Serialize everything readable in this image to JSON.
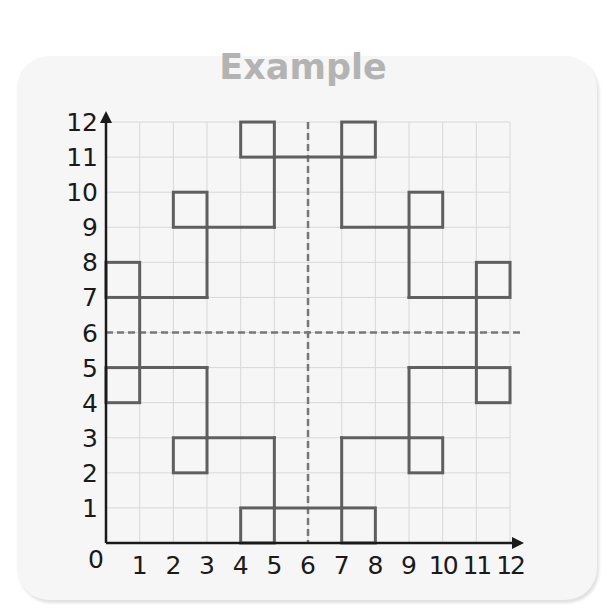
{
  "title": "Example",
  "chart_data": {
    "type": "grid-diagram",
    "title": "Example",
    "xlabel": "",
    "ylabel": "",
    "xlim": [
      0,
      12
    ],
    "ylim": [
      0,
      12
    ],
    "grid": true,
    "x_ticks": [
      "0",
      "1",
      "2",
      "3",
      "4",
      "5",
      "6",
      "7",
      "8",
      "9",
      "10",
      "11",
      "12"
    ],
    "y_ticks": [
      "0",
      "1",
      "2",
      "3",
      "4",
      "5",
      "6",
      "7",
      "8",
      "9",
      "10",
      "11",
      "12"
    ],
    "lines_of_symmetry": [
      {
        "orientation": "vertical",
        "x": 6,
        "style": "dashed"
      },
      {
        "orientation": "horizontal",
        "y": 6,
        "style": "dashed"
      }
    ],
    "squares": [
      {
        "x": 4,
        "y": 11
      },
      {
        "x": 7,
        "y": 11
      },
      {
        "x": 2,
        "y": 9
      },
      {
        "x": 9,
        "y": 9
      },
      {
        "x": 0,
        "y": 7
      },
      {
        "x": 11,
        "y": 7
      },
      {
        "x": 0,
        "y": 4
      },
      {
        "x": 11,
        "y": 4
      },
      {
        "x": 2,
        "y": 2
      },
      {
        "x": 9,
        "y": 2
      },
      {
        "x": 4,
        "y": 0
      },
      {
        "x": 7,
        "y": 0
      }
    ],
    "segments": [
      [
        [
          5,
          11
        ],
        [
          7,
          11
        ]
      ],
      [
        [
          5,
          11
        ],
        [
          5,
          9
        ]
      ],
      [
        [
          3,
          9
        ],
        [
          5,
          9
        ]
      ],
      [
        [
          3,
          9
        ],
        [
          3,
          7
        ]
      ],
      [
        [
          1,
          7
        ],
        [
          3,
          7
        ]
      ],
      [
        [
          7,
          11
        ],
        [
          7,
          9
        ]
      ],
      [
        [
          7,
          9
        ],
        [
          9,
          9
        ]
      ],
      [
        [
          9,
          9
        ],
        [
          9,
          7
        ]
      ],
      [
        [
          9,
          7
        ],
        [
          11,
          7
        ]
      ],
      [
        [
          1,
          7
        ],
        [
          1,
          5
        ]
      ],
      [
        [
          11,
          7
        ],
        [
          11,
          5
        ]
      ],
      [
        [
          1,
          5
        ],
        [
          3,
          5
        ]
      ],
      [
        [
          3,
          5
        ],
        [
          3,
          3
        ]
      ],
      [
        [
          3,
          3
        ],
        [
          5,
          3
        ]
      ],
      [
        [
          5,
          3
        ],
        [
          5,
          1
        ]
      ],
      [
        [
          9,
          5
        ],
        [
          11,
          5
        ]
      ],
      [
        [
          9,
          5
        ],
        [
          9,
          3
        ]
      ],
      [
        [
          7,
          3
        ],
        [
          9,
          3
        ]
      ],
      [
        [
          7,
          3
        ],
        [
          7,
          1
        ]
      ],
      [
        [
          5,
          1
        ],
        [
          7,
          1
        ]
      ]
    ]
  },
  "colors": {
    "shape": "#5f5f5f",
    "axis": "#1a1a1a",
    "grid": "#d8d8d8",
    "dashed": "#777777",
    "title": "#b3b3b3",
    "card": "#f6f6f6"
  }
}
